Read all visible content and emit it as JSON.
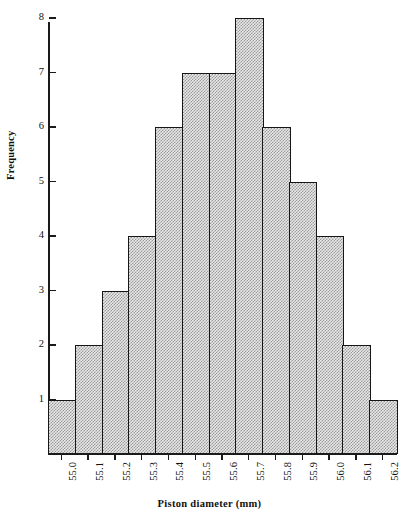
{
  "chart_data": {
    "type": "bar",
    "title": "",
    "xlabel": "Piston diameter (mm)",
    "ylabel": "Frequency",
    "categories": [
      "55.0",
      "55.1",
      "55.2",
      "55.3",
      "55.4",
      "55.5",
      "55.6",
      "55.7",
      "55.8",
      "55.9",
      "56.0",
      "56.1",
      "56.2"
    ],
    "values": [
      1,
      2,
      3,
      4,
      6,
      7,
      7,
      8,
      6,
      5,
      4,
      2,
      1
    ],
    "ylim": [
      0,
      8
    ],
    "y_ticks": [
      "1",
      "2",
      "3",
      "4",
      "5",
      "6",
      "7",
      "8"
    ],
    "grid": false,
    "legend": false,
    "bar_fill_color": "#e8e8e8",
    "bar_pattern_color": "#9a9a9a",
    "bar_edge_color": "#161616",
    "axis_color": "#1a1a1a"
  }
}
